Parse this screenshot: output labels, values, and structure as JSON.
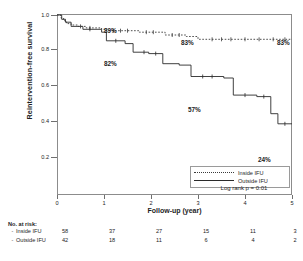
{
  "chart_data": {
    "type": "line",
    "title": "",
    "xlabel": "Follow-up (year)",
    "ylabel": "Reintervention-free survival",
    "xlim": [
      0,
      5
    ],
    "ylim": [
      0.0,
      1.0
    ],
    "xticks": [
      "0",
      "1",
      "2",
      "3",
      "4",
      "5"
    ],
    "yticks": [
      "1.0",
      "0.8",
      "0.6",
      "0.4",
      "0.2"
    ],
    "grid": false,
    "legend_position": "bottom-right",
    "annotations": [
      {
        "label": "89%",
        "x": 1.05,
        "y": 0.89
      },
      {
        "label": "82%",
        "x": 1.05,
        "y": 0.82
      },
      {
        "label": "83%",
        "x": 3.0,
        "y": 0.83
      },
      {
        "label": "83%",
        "x": 4.95,
        "y": 0.83
      },
      {
        "label": "57%",
        "x": 3.0,
        "y": 0.57
      },
      {
        "label": "24%",
        "x": 4.55,
        "y": 0.24
      }
    ],
    "statistic": "Log rank p = 0.01",
    "series": [
      {
        "name": "Inside IFU",
        "style": "dotted",
        "steps": [
          [
            0.0,
            1.0
          ],
          [
            0.08,
            0.98
          ],
          [
            0.14,
            0.96
          ],
          [
            0.2,
            0.94
          ],
          [
            0.3,
            0.93
          ],
          [
            0.45,
            0.92
          ],
          [
            0.62,
            0.91
          ],
          [
            0.95,
            0.9
          ],
          [
            1.05,
            0.89
          ],
          [
            1.75,
            0.88
          ],
          [
            2.3,
            0.86
          ],
          [
            2.75,
            0.85
          ],
          [
            3.0,
            0.83
          ],
          [
            5.0,
            0.83
          ]
        ]
      },
      {
        "name": "Outside IFU",
        "style": "solid",
        "steps": [
          [
            0.0,
            1.0
          ],
          [
            0.1,
            0.97
          ],
          [
            0.18,
            0.95
          ],
          [
            0.3,
            0.92
          ],
          [
            0.55,
            0.9
          ],
          [
            0.95,
            0.88
          ],
          [
            1.05,
            0.82
          ],
          [
            1.45,
            0.8
          ],
          [
            1.62,
            0.74
          ],
          [
            1.95,
            0.73
          ],
          [
            2.25,
            0.66
          ],
          [
            2.6,
            0.65
          ],
          [
            2.85,
            0.57
          ],
          [
            3.55,
            0.56
          ],
          [
            3.75,
            0.44
          ],
          [
            4.25,
            0.43
          ],
          [
            4.55,
            0.31
          ],
          [
            4.7,
            0.24
          ],
          [
            5.0,
            0.24
          ]
        ]
      }
    ]
  },
  "risk_table": {
    "title": "No. at risk:",
    "rows": [
      {
        "label": "Inside IFU",
        "values": [
          "58",
          "37",
          "27",
          "15",
          "11",
          "3"
        ]
      },
      {
        "label": "Outside IFU",
        "values": [
          "42",
          "18",
          "11",
          "6",
          "4",
          "2"
        ]
      }
    ]
  },
  "legend": {
    "items": [
      {
        "label": "Inside IFU",
        "style": "dotted"
      },
      {
        "label": "Outside IFU",
        "style": "solid"
      }
    ]
  }
}
